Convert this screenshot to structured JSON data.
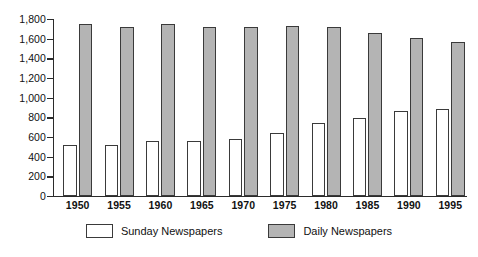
{
  "chart_data": {
    "type": "bar",
    "title": "",
    "subtitle": "",
    "xlabel": "",
    "ylabel": "",
    "categories": [
      "1950",
      "1955",
      "1960",
      "1965",
      "1970",
      "1975",
      "1980",
      "1985",
      "1990",
      "1995"
    ],
    "series": [
      {
        "name": "Sunday Newspapers",
        "color": "#ffffff",
        "values": [
          520,
          520,
          560,
          560,
          580,
          640,
          745,
          800,
          870,
          885
        ]
      },
      {
        "name": "Daily Newspapers",
        "color": "#b4b4b4",
        "values": [
          1750,
          1720,
          1750,
          1720,
          1720,
          1730,
          1720,
          1660,
          1610,
          1570
        ]
      }
    ],
    "ylim": [
      0,
      1800
    ],
    "ytick_values": [
      0,
      200,
      400,
      600,
      800,
      1000,
      1200,
      1400,
      1600,
      1800
    ],
    "ytick_labels": [
      "0",
      "200",
      "400",
      "600",
      "800",
      "1,000",
      "1,200",
      "1,400",
      "1,600",
      "1,800"
    ],
    "grid": false,
    "legend_position": "bottom",
    "legend": [
      "Sunday Newspapers",
      "Daily Newspapers"
    ]
  },
  "legend": {
    "items": [
      {
        "label": "Sunday Newspapers",
        "swatch": "white-square-icon"
      },
      {
        "label": "Daily Newspapers",
        "swatch": "gray-square-icon"
      }
    ]
  },
  "colors": {
    "daily_fill": "#b4b4b4",
    "sunday_fill": "#ffffff",
    "bar_outline": "#3a3a3a",
    "axis": "#2b2b2b",
    "text": "#111111",
    "background": "#ffffff"
  }
}
